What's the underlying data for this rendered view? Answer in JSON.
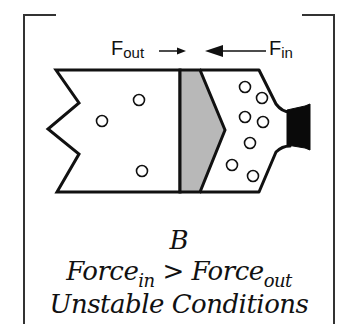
{
  "diagram": {
    "panel_letter": "B",
    "labels": {
      "f_out_base": "F",
      "f_out_sub": "out",
      "f_in_base": "F",
      "f_in_sub": "in"
    },
    "caption": {
      "force_base_left": "Force",
      "force_sub_left": "in",
      "operator": " > ",
      "force_base_right": "Force",
      "force_sub_right": "out",
      "status": "Unstable Conditions"
    },
    "colors": {
      "stroke": "#111111",
      "plug_fill": "#b8b8b8",
      "nozzle_fill": "#0a0a0a",
      "background": "#ffffff"
    },
    "particles": {
      "left_chamber": [
        {
          "cx": 139,
          "cy": 100
        },
        {
          "cx": 102,
          "cy": 121
        },
        {
          "cx": 142,
          "cy": 171
        }
      ],
      "right_chamber": [
        {
          "cx": 245,
          "cy": 87
        },
        {
          "cx": 262,
          "cy": 98
        },
        {
          "cx": 245,
          "cy": 117
        },
        {
          "cx": 263,
          "cy": 122
        },
        {
          "cx": 250,
          "cy": 143
        },
        {
          "cx": 232,
          "cy": 165
        },
        {
          "cx": 253,
          "cy": 176
        }
      ]
    }
  }
}
